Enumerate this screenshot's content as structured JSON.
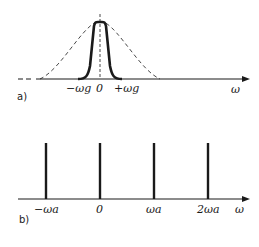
{
  "panel_a": {
    "label": "a)",
    "axis_label": "ω",
    "ticks": [
      "−ωg",
      "0",
      "+ωg"
    ],
    "curves": [
      {
        "name": "broad spectrum",
        "style": "dashed"
      },
      {
        "name": "band-limited spectrum",
        "style": "solid-bold"
      }
    ]
  },
  "panel_b": {
    "label": "b)",
    "axis_label": "ω",
    "ticks": [
      "−ωa",
      "0",
      "ωa",
      "2ωa"
    ],
    "lines": [
      {
        "position": "−ωa"
      },
      {
        "position": "0"
      },
      {
        "position": "ωa"
      },
      {
        "position": "2ωa"
      }
    ]
  },
  "colors": {
    "ink": "#1a1a1a",
    "background": "#ffffff"
  }
}
